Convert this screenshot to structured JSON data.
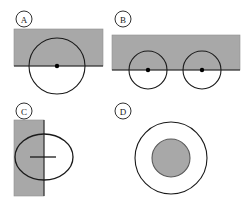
{
  "figure": {
    "title": "",
    "width": 251,
    "height": 204,
    "background_color": "#ffffff",
    "shaded_region_color": "#a8a8a8",
    "shaded_region_stroke": "#8f8f8f",
    "outline_color": "#1a1a1a",
    "dot_color": "#000000",
    "panel_count": 4
  },
  "panels": [
    {
      "id": "A",
      "label": "A",
      "label_cx": 24,
      "label_cy": 19,
      "label_r": 8,
      "description": "Large circle centered on the lower edge of a shaded rectangle; center dot on the boundary line",
      "shaded_rect": {
        "x": 14,
        "y": 29,
        "width": 89,
        "height": 37
      },
      "boundary_line": {
        "x1": 14,
        "y1": 66,
        "x2": 103,
        "y2": 66
      },
      "circles": [
        {
          "cx": 57,
          "cy": 66,
          "r": 28,
          "fill": "none"
        }
      ],
      "dots": [
        {
          "cx": 57,
          "cy": 66,
          "r": 2.2
        }
      ],
      "segments": []
    },
    {
      "id": "B",
      "label": "B",
      "label_cx": 123,
      "label_cy": 19,
      "label_r": 8,
      "description": "Two equal circles centered on the lower edge of a wide shaded rectangle; each has a center dot on the boundary line",
      "shaded_rect": {
        "x": 112,
        "y": 35,
        "width": 128,
        "height": 35
      },
      "boundary_line": {
        "x1": 112,
        "y1": 70,
        "x2": 240,
        "y2": 70
      },
      "circles": [
        {
          "cx": 148,
          "cy": 70,
          "r": 19,
          "fill": "none"
        },
        {
          "cx": 202,
          "cy": 70,
          "r": 19,
          "fill": "none"
        }
      ],
      "dots": [
        {
          "cx": 148,
          "cy": 70,
          "r": 2.2
        },
        {
          "cx": 202,
          "cy": 70,
          "r": 2.2
        }
      ],
      "segments": []
    },
    {
      "id": "C",
      "label": "C",
      "label_cx": 24,
      "label_cy": 111,
      "label_r": 8,
      "description": "Oval overlapping a vertical shaded rectangle; short horizontal segment inside the oval crossing the rectangle edge",
      "shaded_rect": {
        "x": 14,
        "y": 120,
        "width": 30,
        "height": 76
      },
      "boundary_line": {
        "x1": 44,
        "y1": 120,
        "x2": 44,
        "y2": 196
      },
      "ovals": [
        {
          "cx": 44,
          "cy": 157,
          "rx": 29,
          "ry": 23,
          "fill": "none"
        }
      ],
      "dots": [],
      "segments": [
        {
          "x1": 30,
          "y1": 157,
          "x2": 56,
          "y2": 157
        }
      ]
    },
    {
      "id": "D",
      "label": "D",
      "label_cx": 123,
      "label_cy": 111,
      "label_r": 8,
      "description": "Shaded inner disc concentric inside a larger unshaded outline circle",
      "shaded_rect": null,
      "boundary_line": null,
      "circles": [
        {
          "cx": 171,
          "cy": 158,
          "r": 36,
          "fill": "none"
        },
        {
          "cx": 171,
          "cy": 158,
          "r": 19,
          "fill": "shaded"
        }
      ],
      "dots": [],
      "segments": []
    }
  ]
}
